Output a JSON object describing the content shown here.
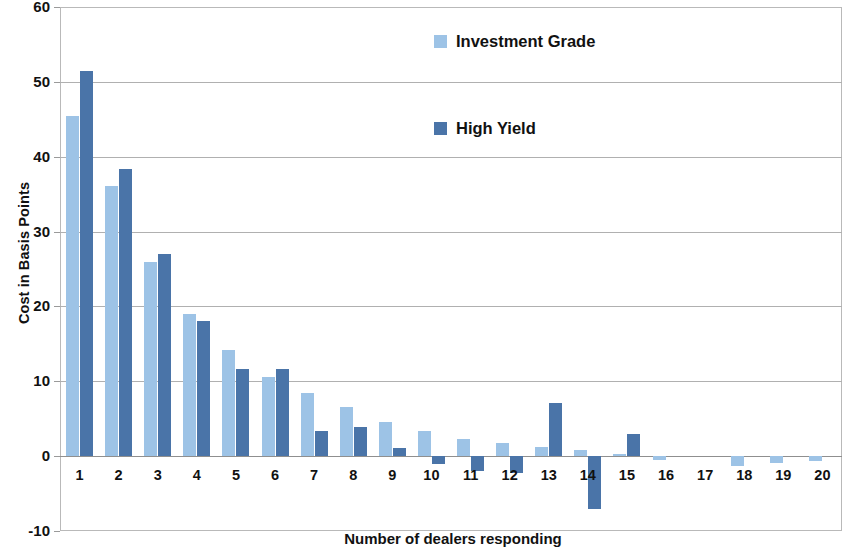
{
  "chart_data": {
    "type": "bar",
    "title": "",
    "xlabel": "Number of dealers responding",
    "ylabel": "Cost in Basis Points",
    "categories": [
      "1",
      "2",
      "3",
      "4",
      "5",
      "6",
      "7",
      "8",
      "9",
      "10",
      "11",
      "12",
      "13",
      "14",
      "15",
      "16",
      "17",
      "18",
      "19",
      "20"
    ],
    "series": [
      {
        "name": "Investment Grade",
        "color": "#9dc3e6",
        "values": [
          45.4,
          36.1,
          25.9,
          19.0,
          14.2,
          10.6,
          8.5,
          6.6,
          4.5,
          3.3,
          2.3,
          1.7,
          1.2,
          0.8,
          0.3,
          -0.5,
          0.0,
          -1.3,
          -0.9,
          -0.6
        ]
      },
      {
        "name": "High Yield",
        "color": "#4a74a8",
        "values": [
          51.5,
          38.4,
          27.0,
          18.1,
          11.7,
          11.7,
          3.4,
          3.9,
          1.1,
          -1.0,
          -2.0,
          -2.3,
          7.1,
          -7.1,
          2.9,
          0.0,
          0.0,
          0.0,
          0.0,
          0.0
        ]
      }
    ],
    "ylim": [
      -10,
      60
    ],
    "yticks": [
      60,
      50,
      40,
      30,
      20,
      10,
      0,
      -10
    ],
    "grid": true,
    "legend_position": "inside-top-center"
  },
  "axis": {
    "y_title": "Cost in Basis Points",
    "x_title": "Number of dealers responding"
  },
  "legend": {
    "items": [
      {
        "label": "Investment Grade",
        "color": "#9dc3e6"
      },
      {
        "label": "High Yield",
        "color": "#4a74a8"
      }
    ]
  }
}
